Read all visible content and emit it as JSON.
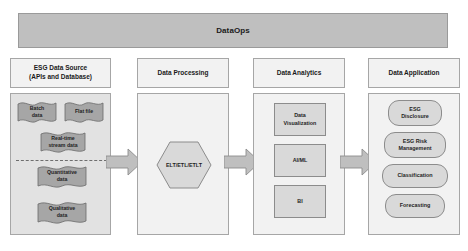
{
  "banner": {
    "title": "DataOps"
  },
  "columns": [
    {
      "id": "esg-data-source",
      "header": "ESG Data Source (APIs and Database)",
      "header_line1": "ESG Data Source",
      "header_line2": "(APIs and Database)",
      "items": [
        {
          "id": "batch-data",
          "label": "Batch data",
          "line1": "Batch",
          "line2": "data"
        },
        {
          "id": "flat-file",
          "label": "Flat file",
          "line1": "Flat file",
          "line2": ""
        },
        {
          "id": "real-time-stream-data",
          "label": "Real-time stream data",
          "line1": "Real-time",
          "line2": "stream data"
        },
        {
          "id": "quantitative-data",
          "label": "Quantitative data",
          "line1": "Quantitative",
          "line2": "data"
        },
        {
          "id": "qualitative-data",
          "label": "Qualitative data",
          "line1": "Qualitative",
          "line2": "data"
        }
      ]
    },
    {
      "id": "data-processing",
      "header": "Data Processing",
      "items": [
        {
          "id": "elt-etl-etlt",
          "label": "ELT/ETL/ETLT"
        }
      ]
    },
    {
      "id": "data-analytics",
      "header": "Data Analytics",
      "items": [
        {
          "id": "data-visualization",
          "label": "Data Visualization",
          "line1": "Data",
          "line2": "Visualization"
        },
        {
          "id": "ai-ml",
          "label": "AI/ML",
          "line1": "AI/ML",
          "line2": ""
        },
        {
          "id": "bi",
          "label": "BI",
          "line1": "BI",
          "line2": ""
        }
      ]
    },
    {
      "id": "data-application",
      "header": "Data Application",
      "items": [
        {
          "id": "esg-disclosure",
          "label": "ESG Disclosure",
          "line1": "ESG",
          "line2": "Disclosure"
        },
        {
          "id": "esg-risk-management",
          "label": "ESG Risk Management",
          "line1": "ESG Risk",
          "line2": "Management"
        },
        {
          "id": "classification",
          "label": "Classification",
          "line1": "Classification",
          "line2": ""
        },
        {
          "id": "forecasting",
          "label": "Forecasting",
          "line1": "Forecasting",
          "line2": ""
        }
      ]
    }
  ],
  "arrows": [
    {
      "id": "arrow-source-to-processing",
      "label": ""
    },
    {
      "id": "arrow-processing-to-analytics",
      "label": ""
    },
    {
      "id": "arrow-analytics-to-application",
      "label": ""
    }
  ],
  "colors": {
    "banner_fill": "#bfbfbf",
    "panel_shaded": "#e2e2e2",
    "panel_light": "#f2f2f2",
    "node_fill": "#d9d9d9",
    "flag_fill": "#a6a6a6",
    "border": "#a6a6a6",
    "text": "#1f1f1f"
  }
}
